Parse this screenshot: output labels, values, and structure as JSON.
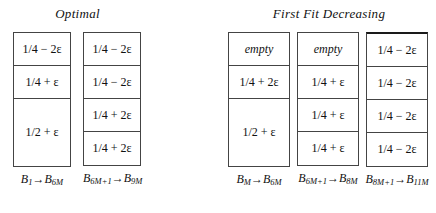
{
  "figure": {
    "sections": [
      {
        "title": "Optimal",
        "bins": [
          {
            "label_prefix": "B",
            "label_start_sub": "1",
            "label_arrow": "→",
            "label_suffix": "B",
            "label_end_sub": "6M",
            "cells": [
              {
                "text": "1/4 − 2ε",
                "style": "normal"
              },
              {
                "text": "1/4 + ε",
                "style": "normal"
              },
              {
                "text": "1/2 + ε",
                "style": "normal",
                "size": "tall"
              }
            ]
          },
          {
            "label_prefix": "B",
            "label_start_sub": "6M+1",
            "label_arrow": "→",
            "label_suffix": "B",
            "label_end_sub": "9M",
            "cells": [
              {
                "text": "1/4 − 2ε",
                "style": "normal"
              },
              {
                "text": "1/4 − 2ε",
                "style": "normal"
              },
              {
                "text": "1/4 + 2ε",
                "style": "normal"
              },
              {
                "text": "1/4 + 2ε",
                "style": "normal"
              }
            ]
          }
        ]
      },
      {
        "title": "First Fit Decreasing",
        "bins": [
          {
            "label_prefix": "B",
            "label_start_sub": "M",
            "label_arrow": "→",
            "label_suffix": "B",
            "label_end_sub": "6M",
            "cells": [
              {
                "text": "empty",
                "style": "italic"
              },
              {
                "text": "1/4 + 2ε",
                "style": "normal"
              },
              {
                "text": "1/2 + ε",
                "style": "normal",
                "size": "tall"
              }
            ]
          },
          {
            "label_prefix": "B",
            "label_start_sub": "6M+1",
            "label_arrow": "→",
            "label_suffix": "B",
            "label_end_sub": "8M",
            "cells": [
              {
                "text": "empty",
                "style": "italic"
              },
              {
                "text": "1/4 + ε",
                "style": "normal"
              },
              {
                "text": "1/4 + ε",
                "style": "normal"
              },
              {
                "text": "1/4 + ε",
                "style": "normal"
              }
            ]
          },
          {
            "label_prefix": "B",
            "label_start_sub": "8M+1",
            "label_arrow": "→",
            "label_suffix": "B",
            "label_end_sub": "11M",
            "cells": [
              {
                "text": "1/4 − 2ε",
                "style": "normal"
              },
              {
                "text": "1/4 − 2ε",
                "style": "normal"
              },
              {
                "text": "1/4 − 2ε",
                "style": "normal"
              },
              {
                "text": "1/4 − 2ε",
                "style": "normal"
              }
            ]
          }
        ]
      }
    ]
  }
}
